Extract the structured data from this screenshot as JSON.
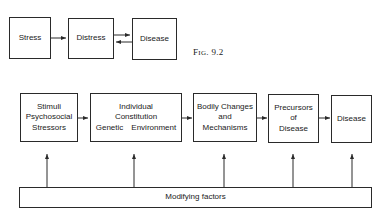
{
  "figure_9_2": {
    "caption_prefix": "F",
    "caption_smallcaps": "IG",
    "caption_number": ". 9.2",
    "boxes": [
      {
        "label": "Stress"
      },
      {
        "label": "Distress"
      },
      {
        "label": "Disease"
      }
    ],
    "arrows": [
      "Stress -> Distress",
      "Distress -> Disease",
      "Disease -> Distress"
    ]
  },
  "figure_9_3": {
    "boxes": [
      {
        "lines": [
          "Stimuli",
          "Psychosocial",
          "Stressors"
        ]
      },
      {
        "lines": [
          "Individual",
          "Constitution"
        ],
        "sub": [
          "Genetic",
          "Environment"
        ]
      },
      {
        "lines": [
          "Bodily Changes",
          "and",
          "Mechanisms"
        ]
      },
      {
        "lines": [
          "Precursors",
          "of",
          "Disease"
        ]
      },
      {
        "lines": [
          "Disease"
        ]
      }
    ],
    "modifying_bar": {
      "label": "Modifying factors"
    },
    "arrows": [
      "box1 -> box2",
      "box2 -> box3",
      "box3 -> box4",
      "box4 -> box5",
      "Modifying factors -> each box"
    ]
  },
  "colors": {
    "line": "#2a2a2a",
    "background": "#ffffff"
  }
}
